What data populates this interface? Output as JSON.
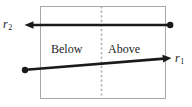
{
  "figure": {
    "name": "ray-above-below-diagram",
    "background_color": "#ffffff"
  },
  "box": {
    "name": "bounding-rectangle",
    "stroke_color": "#a8a8a8",
    "x": 40,
    "y": 6,
    "width": 125,
    "height": 92
  },
  "divider": {
    "name": "vertical-dotted-divider",
    "stroke_color": "#b0b0b0",
    "x": 101,
    "y_top": 6,
    "y_bottom": 98,
    "style": "dotted"
  },
  "regions": [
    {
      "key": "below",
      "label": "Below"
    },
    {
      "key": "above",
      "label": "Above"
    }
  ],
  "rays": [
    {
      "key": "r2",
      "label": "r",
      "subscript": "2",
      "color": "#1a1a1a",
      "start_x": 171,
      "start_y": 25,
      "end_x": 25,
      "end_y": 25,
      "start_marker": "dot",
      "end_marker": "arrowhead",
      "direction": "leftward"
    },
    {
      "key": "r1",
      "label": "r",
      "subscript": "1",
      "color": "#1a1a1a",
      "start_x": 24,
      "start_y": 70,
      "end_x": 171,
      "end_y": 58,
      "start_marker": "dot",
      "end_marker": "arrowhead",
      "direction": "rightward"
    }
  ]
}
